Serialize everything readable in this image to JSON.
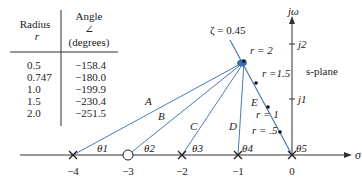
{
  "table": {
    "col1_header": "Radius",
    "col1_sub": "r",
    "col2_header": "Angle",
    "col2_symbol": "∠",
    "col2_sub": "(degrees)",
    "rows": [
      {
        "r": "0.5",
        "angle": "−158.4"
      },
      {
        "r": "0.747",
        "angle": "−180.0"
      },
      {
        "r": "1.0",
        "angle": "−199.9"
      },
      {
        "r": "1.5",
        "angle": "−230.4"
      },
      {
        "r": "2.0",
        "angle": "−251.5"
      }
    ]
  },
  "plane": {
    "label": "s-plane",
    "imag_axis": "jω",
    "real_axis": "σ",
    "imag_ticks": [
      "j2",
      "j1"
    ],
    "real_ticks": [
      "−4",
      "−3",
      "−2",
      "−1",
      "0"
    ],
    "zeta_label": "ζ = 0.45",
    "radius_labels": [
      "r = 2",
      "r =1.5",
      "r = 1",
      "r = .5"
    ],
    "vector_labels": [
      "A",
      "B",
      "C",
      "D",
      "E"
    ],
    "angle_labels": [
      "θ1",
      "θ2",
      "θ3",
      "θ4",
      "θ5"
    ]
  },
  "colors": {
    "vector": "#4a7ab5",
    "axis": "#333333",
    "point": "#3a6db0"
  }
}
